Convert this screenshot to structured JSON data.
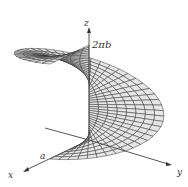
{
  "figure": {
    "type": "3d-parametric-surface",
    "axes": {
      "x_label": "x",
      "y_label": "y",
      "z_label": "z"
    },
    "annotations": {
      "radius_label": "a",
      "height_label": "2πb"
    },
    "colors": {
      "surface_fill": "#e6e6e6",
      "mesh_line": "#333333",
      "axis_line": "#444444",
      "background": "#ffffff"
    }
  }
}
